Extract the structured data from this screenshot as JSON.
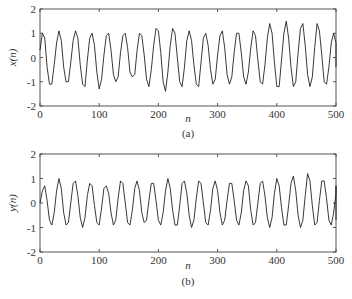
{
  "chart_data": [
    {
      "type": "line",
      "id": "a",
      "caption": "(a)",
      "xlabel": "n",
      "ylabel": "x(n)",
      "xlim": [
        0,
        500
      ],
      "ylim": [
        -2,
        2
      ],
      "xticks": [
        0,
        100,
        200,
        300,
        400,
        500
      ],
      "yticks": [
        -2,
        -1,
        0,
        1,
        2
      ],
      "xtick_labels": [
        "0",
        "100",
        "200",
        "300",
        "400",
        "500"
      ],
      "ytick_labels": [
        "-2",
        "-1",
        "0",
        "1",
        "2"
      ],
      "grid": false,
      "line_color": "#222222",
      "x_step": 4,
      "values": [
        0.3,
        1.0,
        0.8,
        -0.4,
        -1.1,
        -1.1,
        -0.3,
        0.6,
        1.1,
        0.7,
        -0.4,
        -1.0,
        -1.0,
        -0.2,
        0.7,
        1.1,
        0.8,
        -0.3,
        -1.1,
        -1.2,
        -0.1,
        0.8,
        1.0,
        0.5,
        -0.6,
        -1.3,
        -0.9,
        0.1,
        0.9,
        1.0,
        0.3,
        -0.7,
        -1.0,
        -0.8,
        0.2,
        0.9,
        1.0,
        0.4,
        -0.6,
        -0.8,
        -0.7,
        0.3,
        1.0,
        0.9,
        0.1,
        -0.9,
        -1.2,
        -0.5,
        0.5,
        1.2,
        1.1,
        0.2,
        -1.0,
        -1.4,
        -0.6,
        0.5,
        1.2,
        1.0,
        0.0,
        -1.0,
        -1.2,
        -0.4,
        0.7,
        1.1,
        0.7,
        -0.3,
        -1.1,
        -1.2,
        -0.2,
        0.8,
        1.0,
        0.5,
        -0.5,
        -1.1,
        -0.9,
        0.1,
        0.9,
        1.1,
        0.4,
        -0.7,
        -1.1,
        -0.8,
        0.2,
        1.0,
        1.0,
        0.2,
        -0.8,
        -1.1,
        -0.6,
        0.4,
        1.1,
        0.9,
        -0.1,
        -1.0,
        -1.1,
        -0.3,
        0.8,
        1.4,
        1.0,
        -0.2,
        -1.2,
        -1.2,
        -0.1,
        1.0,
        1.5,
        0.8,
        -0.4,
        -1.2,
        -1.0,
        0.2,
        1.2,
        1.4,
        0.5,
        -0.7,
        -1.2,
        -0.8,
        0.4,
        1.4,
        1.1,
        0.1,
        -1.0,
        -1.1,
        -0.4,
        0.6,
        1.0,
        0.6,
        -0.4
      ]
    },
    {
      "type": "line",
      "id": "b",
      "caption": "(b)",
      "xlabel": "n",
      "ylabel": "y(n)",
      "xlim": [
        0,
        500
      ],
      "ylim": [
        -2,
        2
      ],
      "xticks": [
        0,
        100,
        200,
        300,
        400,
        500
      ],
      "yticks": [
        -2,
        -1,
        0,
        1,
        2
      ],
      "xtick_labels": [
        "0",
        "100",
        "200",
        "300",
        "400",
        "500"
      ],
      "ytick_labels": [
        "-2",
        "-1",
        "0",
        "1",
        "2"
      ],
      "grid": false,
      "line_color": "#222222",
      "x_step": 4,
      "values": [
        0.0,
        0.5,
        0.7,
        0.1,
        -0.7,
        -0.9,
        -0.4,
        0.5,
        1.0,
        0.6,
        -0.4,
        -0.9,
        -0.8,
        0.0,
        0.8,
        0.9,
        0.3,
        -0.6,
        -1.0,
        -0.6,
        0.3,
        0.8,
        0.7,
        -0.1,
        -0.8,
        -0.9,
        -0.2,
        0.6,
        0.7,
        0.4,
        -0.4,
        -0.9,
        -0.7,
        0.2,
        0.9,
        0.8,
        0.0,
        -0.8,
        -0.9,
        -0.3,
        0.6,
        0.9,
        0.5,
        -0.4,
        -0.8,
        -0.7,
        0.1,
        0.8,
        0.8,
        0.1,
        -0.7,
        -0.9,
        -0.4,
        0.5,
        1.0,
        0.6,
        -0.3,
        -0.9,
        -0.9,
        -0.1,
        0.8,
        0.9,
        0.4,
        -0.5,
        -1.0,
        -0.7,
        0.2,
        0.9,
        0.8,
        0.0,
        -0.8,
        -0.9,
        -0.3,
        0.6,
        0.9,
        0.5,
        -0.4,
        -0.9,
        -0.7,
        0.1,
        0.8,
        0.8,
        0.1,
        -0.7,
        -0.9,
        -0.4,
        0.5,
        0.9,
        0.7,
        -0.3,
        -0.9,
        -0.8,
        0.0,
        0.8,
        0.9,
        0.3,
        -0.6,
        -1.0,
        -0.6,
        0.4,
        1.0,
        0.7,
        -0.2,
        -0.9,
        -0.9,
        -0.1,
        0.8,
        1.1,
        0.5,
        -0.5,
        -1.0,
        -0.7,
        0.3,
        1.2,
        0.9,
        -0.1,
        -0.9,
        -0.8,
        0.1,
        0.9,
        0.9,
        0.2,
        -0.7,
        -0.9,
        -0.4,
        0.4,
        0.7,
        0.3,
        -0.7
      ]
    }
  ]
}
